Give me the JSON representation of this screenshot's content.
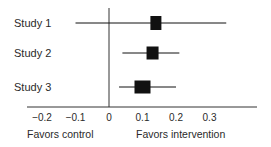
{
  "chart_data": {
    "type": "forest",
    "title": "",
    "xlabel_left": "Favors control",
    "xlabel_right": "Favors intervention",
    "xlim": [
      -0.25,
      0.42
    ],
    "xticks": [
      -0.2,
      -0.1,
      0,
      0.1,
      0.2,
      0.3
    ],
    "xtick_labels": [
      "−0.2",
      "−0.1",
      "0",
      "0.1",
      "0.2",
      "0.3"
    ],
    "reference_line": 0,
    "studies": [
      {
        "label": "Study 1",
        "estimate": 0.14,
        "ci_low": -0.1,
        "ci_high": 0.35,
        "weight": "small"
      },
      {
        "label": "Study 2",
        "estimate": 0.13,
        "ci_low": 0.04,
        "ci_high": 0.21,
        "weight": "medium"
      },
      {
        "label": "Study 3",
        "estimate": 0.1,
        "ci_low": 0.03,
        "ci_high": 0.2,
        "weight": "large"
      }
    ],
    "grid": false
  },
  "colors": {
    "ink": "#111111",
    "axis": "#333333",
    "text": "#2a2a2a"
  }
}
